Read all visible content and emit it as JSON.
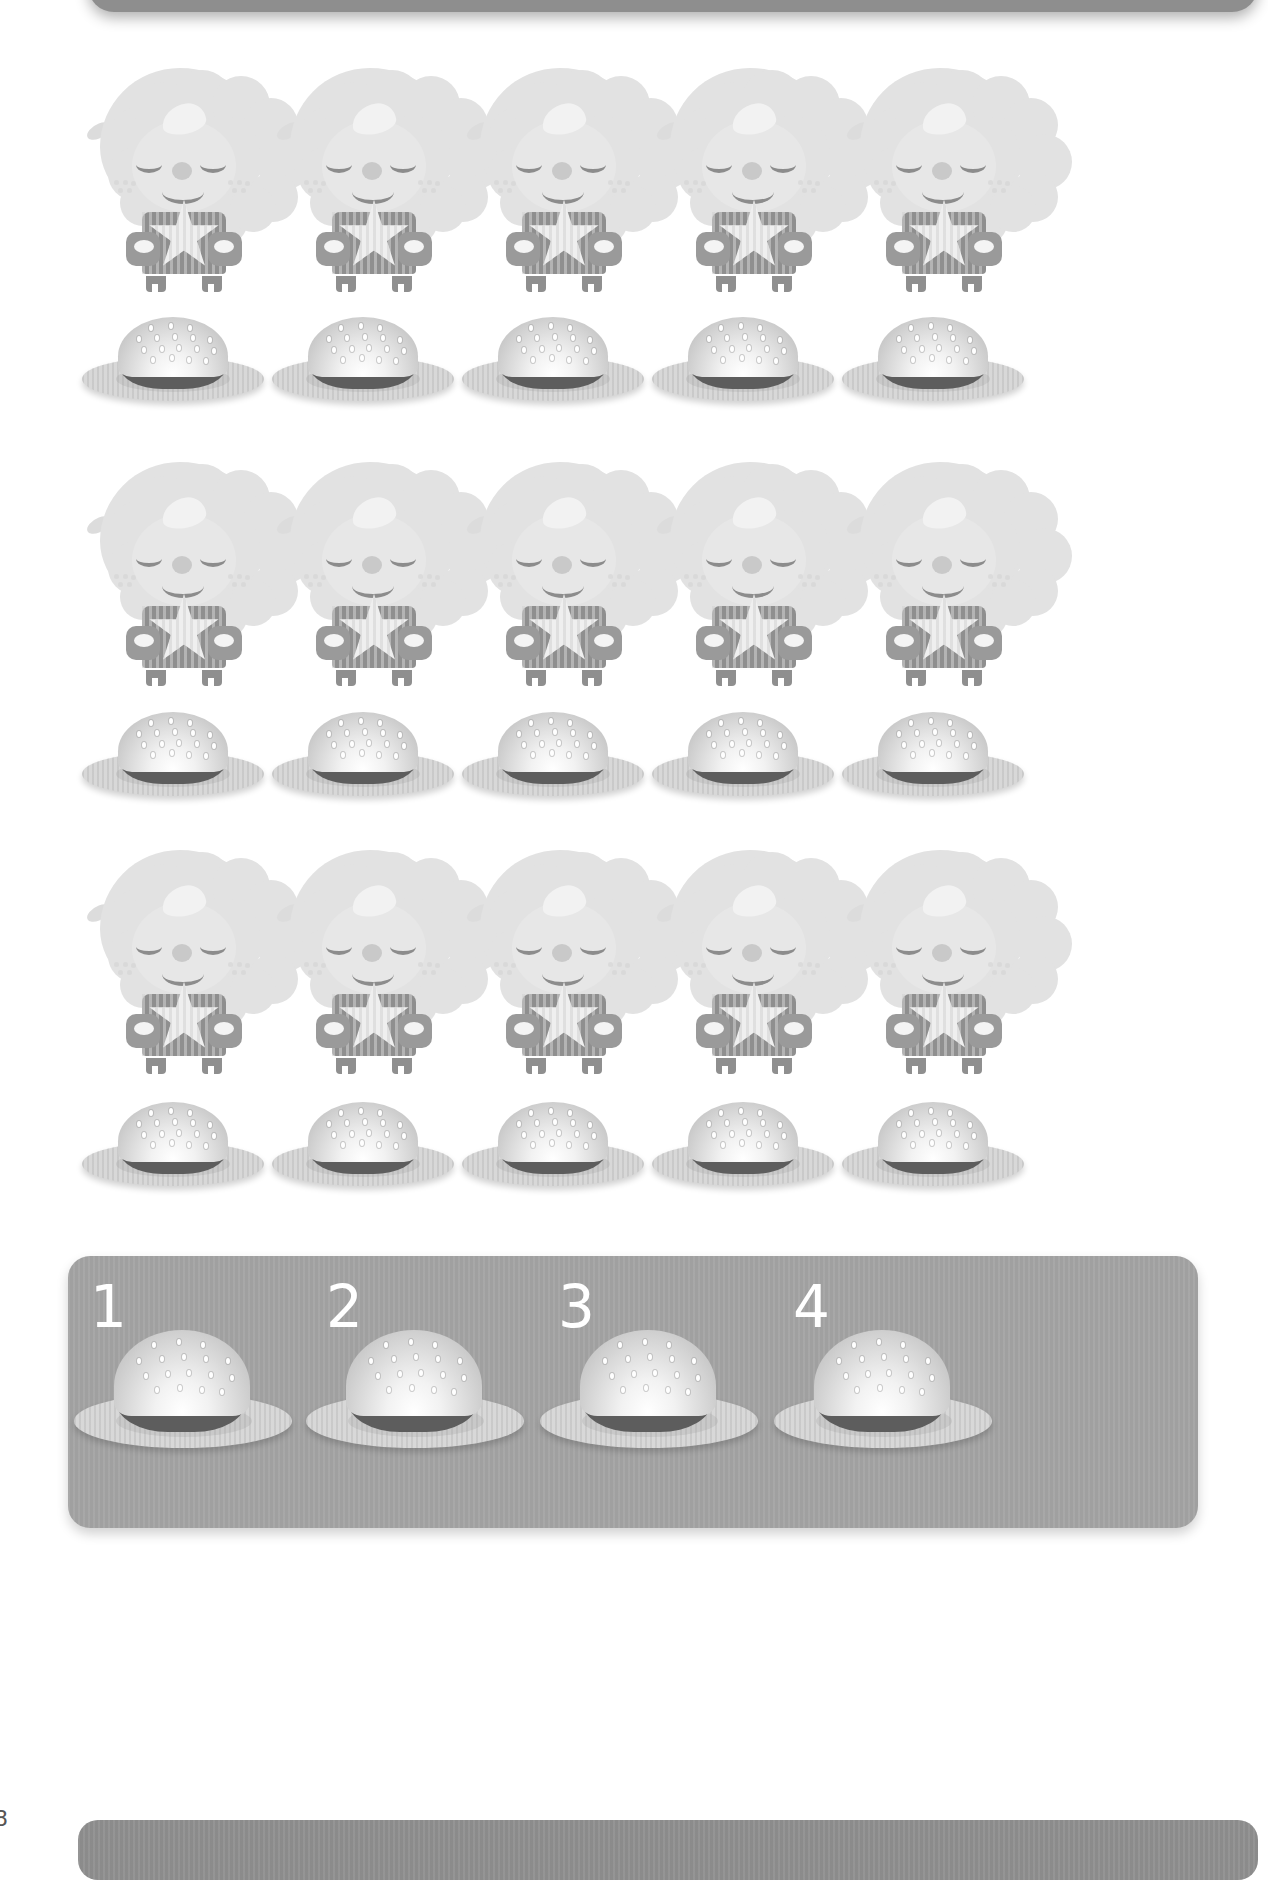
{
  "page": {
    "page_number": "8",
    "background_color": "#ffffff"
  },
  "top_panel": {
    "name": "header-banner",
    "color": "#8e8e8e"
  },
  "rows": [
    {
      "id": "row-1",
      "sheep_count": 5,
      "burger_count": 5,
      "sheep_label": "sheep",
      "burger_label": "hamburger-on-plate"
    },
    {
      "id": "row-2",
      "sheep_count": 5,
      "burger_count": 5,
      "sheep_label": "sheep",
      "burger_label": "hamburger-on-plate"
    },
    {
      "id": "row-3",
      "sheep_count": 5,
      "burger_count": 5,
      "sheep_label": "sheep",
      "burger_label": "hamburger-on-plate"
    }
  ],
  "answer_panel": {
    "name": "answer-options-panel",
    "color": "#a3a3a3",
    "options": [
      {
        "number": "1",
        "item": "hamburger-on-plate"
      },
      {
        "number": "2",
        "item": "hamburger-on-plate"
      },
      {
        "number": "3",
        "item": "hamburger-on-plate"
      },
      {
        "number": "4",
        "item": "hamburger-on-plate"
      }
    ]
  },
  "bottom_bar": {
    "name": "footer-banner",
    "color": "#8e8e8e"
  },
  "chart_data": {
    "type": "table",
    "categories": [
      "Row 1",
      "Row 2",
      "Row 3"
    ],
    "series": [
      {
        "name": "Sheep",
        "values": [
          5,
          5,
          5
        ]
      },
      {
        "name": "Hamburgers",
        "values": [
          5,
          5,
          5
        ]
      }
    ],
    "answer_choices": [
      1,
      2,
      3,
      4
    ],
    "xlabel": "",
    "ylabel": "Count"
  }
}
